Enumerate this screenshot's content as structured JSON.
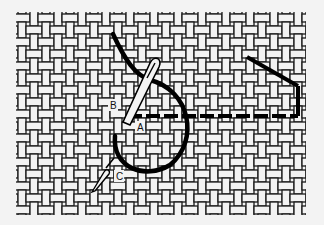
{
  "figure": {
    "background": "#f3f3f3",
    "grid_color": "#1a1a1a",
    "thread_color": "#000000",
    "cell_size": 12,
    "grid_origin": [
      16,
      12
    ],
    "cols": 24,
    "rows": 17
  },
  "labels": {
    "a": "A",
    "b": "B",
    "c": "C"
  }
}
